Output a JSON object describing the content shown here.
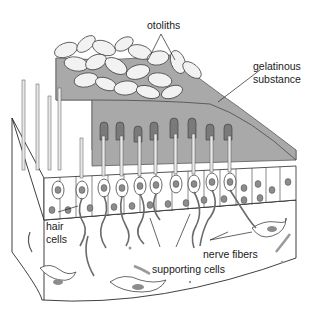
{
  "figure": {
    "colors": {
      "gel": "#a9a9a9",
      "gel_edge": "#5a5a5a",
      "otolith": "#f2f2f2",
      "cell_fill": "#ffffff",
      "nucleus": "#8c8c8c",
      "line": "#2a2a2a",
      "background": "#ffffff"
    }
  },
  "labels": {
    "otoliths": "otoliths",
    "gelatinous_1": "gelatinous",
    "gelatinous_2": "substance",
    "hair_1": "hair",
    "hair_2": "cells",
    "nerve_fibers": "nerve fibers",
    "supporting_cells": "supporting cells"
  }
}
